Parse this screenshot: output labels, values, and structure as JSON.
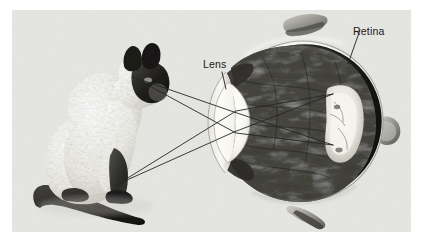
{
  "figure": {
    "kind": "anatomical-optics-diagram",
    "canvas": {
      "width": 423,
      "height": 242,
      "background": "#ffffff"
    },
    "photo_frame": {
      "x": 12,
      "y": 10,
      "width": 399,
      "height": 222,
      "background": "#e9e9e7"
    }
  },
  "labels": [
    {
      "id": "lens",
      "text": "Lens",
      "x": 203,
      "y": 59,
      "leader_to_x": 224,
      "leader_to_y": 88
    },
    {
      "id": "retina",
      "text": "Retina",
      "x": 353,
      "y": 26,
      "leader_to_x": 349,
      "leader_to_y": 63
    }
  ],
  "label_text": {
    "lens": "Lens",
    "retina": "Retina"
  },
  "subject_object": {
    "name": "cat",
    "breed_appearance": "siamese-seated-facing-right",
    "bounds": {
      "x": 26,
      "y": 62,
      "width": 120,
      "height": 158
    }
  },
  "eye": {
    "name": "eye-cross-section",
    "center_x": 303,
    "center_y": 121,
    "radius_x": 79,
    "radius_y": 79,
    "colors": {
      "sclera": "#f2f1ee",
      "sclera_outline": "#4a4a48",
      "choroid_ring": "#2a2a28",
      "vitreous": "#3b3b39",
      "retina_highlight": "#e9e7e0",
      "lens": "#f7f6f1",
      "cornea": "#ddddd8"
    },
    "parts": [
      {
        "name": "cornea",
        "label_shown": false
      },
      {
        "name": "lens",
        "label_shown": true
      },
      {
        "name": "vitreous-humor",
        "label_shown": false
      },
      {
        "name": "retina",
        "label_shown": true
      },
      {
        "name": "optic-disc",
        "label_shown": false
      },
      {
        "name": "extraocular-muscle-top",
        "label_shown": false
      },
      {
        "name": "extraocular-muscle-bottom",
        "label_shown": false
      },
      {
        "name": "extraocular-muscle-right",
        "label_shown": false
      }
    ]
  },
  "light_rays": {
    "stroke": "#262626",
    "stroke_width": 0.9,
    "description": "Two object points on the cat each emit two rays that cross at the lens and converge inverted on the retina",
    "source_points": [
      {
        "id": "cat-head-top",
        "x": 133,
        "y": 77
      },
      {
        "id": "cat-paw-bottom",
        "x": 118,
        "y": 184
      }
    ],
    "image_points": [
      {
        "id": "retina-upper",
        "x": 333,
        "y": 95
      },
      {
        "id": "retina-lower",
        "x": 333,
        "y": 147
      }
    ],
    "segments": [
      {
        "from": "cat-head-top",
        "via_x": 236,
        "via_y": 134,
        "to": "retina-lower"
      },
      {
        "from": "cat-head-top",
        "via_x": 234,
        "via_y": 113,
        "to": "retina-lower"
      },
      {
        "from": "cat-paw-bottom",
        "via_x": 236,
        "via_y": 112,
        "to": "retina-upper"
      },
      {
        "from": "cat-paw-bottom",
        "via_x": 234,
        "via_y": 133,
        "to": "retina-upper"
      }
    ]
  },
  "palette": {
    "background": "#ffffff",
    "photo_background": "#e9e9e7",
    "ink": "#1a1a1a",
    "ray_line": "#262626"
  }
}
